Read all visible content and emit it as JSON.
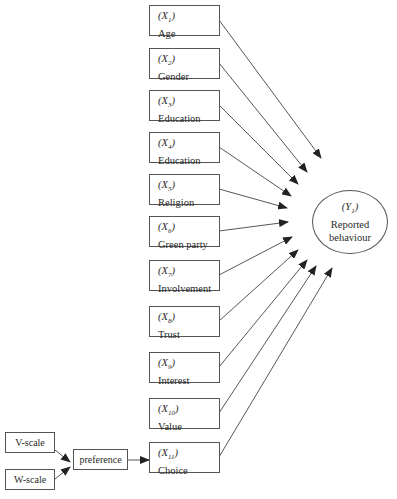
{
  "diagram": {
    "outcome": {
      "var": "Y",
      "sub": "1",
      "label_line1": "Reported",
      "label_line2": "behaviour"
    },
    "predictors": [
      {
        "var": "X",
        "sub": "1",
        "label": "Age"
      },
      {
        "var": "X",
        "sub": "2",
        "label": "Gender"
      },
      {
        "var": "X",
        "sub": "3",
        "label": "Education"
      },
      {
        "var": "X",
        "sub": "4",
        "label": "Education"
      },
      {
        "var": "X",
        "sub": "5",
        "label": "Religion"
      },
      {
        "var": "X",
        "sub": "6",
        "label": "Green party"
      },
      {
        "var": "X",
        "sub": "7",
        "label": "Involvement"
      },
      {
        "var": "X",
        "sub": "8",
        "label": "Trust"
      },
      {
        "var": "X",
        "sub": "9",
        "label": "Interest"
      },
      {
        "var": "X",
        "sub": "10",
        "label": "Value"
      },
      {
        "var": "X",
        "sub": "11",
        "label": "Choice"
      }
    ],
    "scales": {
      "v": "V-scale",
      "w": "W-scale"
    },
    "preference": "preference",
    "edges": [
      "X1 -> Y1",
      "X2 -> Y1",
      "X3 -> Y1",
      "X4 -> Y1",
      "X5 -> Y1",
      "X6 -> Y1",
      "X7 -> Y1",
      "X8 -> Y1",
      "X9 -> Y1",
      "X10 -> Y1",
      "X11 -> Y1",
      "V-scale -> preference",
      "W-scale -> preference",
      "preference -> X11"
    ],
    "colors": {
      "stroke": "#555555",
      "text": "#2a2a2a",
      "background": "#ffffff"
    }
  }
}
